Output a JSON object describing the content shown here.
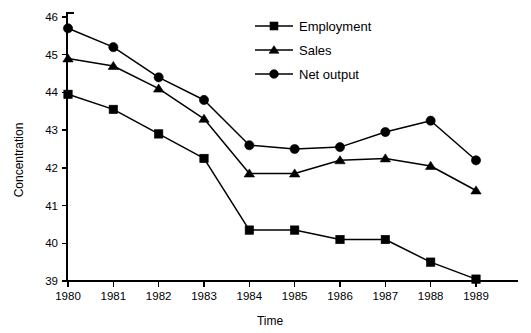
{
  "chart_data": {
    "type": "line",
    "title": "",
    "xlabel": "Time",
    "ylabel": "Concentration",
    "categories": [
      "1980",
      "1981",
      "1982",
      "1983",
      "1984",
      "1985",
      "1986",
      "1987",
      "1988",
      "1989"
    ],
    "x": [
      1980,
      1981,
      1982,
      1983,
      1984,
      1985,
      1986,
      1987,
      1988,
      1989
    ],
    "xlim": [
      1980,
      1989
    ],
    "ylim": [
      39,
      46
    ],
    "yticks": [
      39,
      40,
      41,
      42,
      43,
      44,
      45,
      46
    ],
    "ytick_labels": [
      "39",
      "40",
      "41",
      "42",
      "43",
      "44",
      "45",
      "46"
    ],
    "grid": false,
    "legend_position": "top-center",
    "series": [
      {
        "name": "Employment",
        "marker": "square",
        "values": [
          43.95,
          43.55,
          42.9,
          42.25,
          40.35,
          40.35,
          40.1,
          40.1,
          39.5,
          39.05
        ]
      },
      {
        "name": "Sales",
        "marker": "triangle",
        "values": [
          44.9,
          44.7,
          44.1,
          43.3,
          41.85,
          41.85,
          42.2,
          42.25,
          42.05,
          41.4
        ]
      },
      {
        "name": "Net output",
        "marker": "circle",
        "values": [
          45.7,
          45.2,
          44.4,
          43.8,
          42.6,
          42.5,
          42.55,
          42.95,
          43.25,
          42.2
        ]
      }
    ]
  },
  "axes": {
    "y_title": "Concentration",
    "x_title": "Time"
  },
  "legend": {
    "entries": [
      {
        "label": "Employment",
        "marker": "square"
      },
      {
        "label": "Sales",
        "marker": "triangle"
      },
      {
        "label": "Net output",
        "marker": "circle"
      }
    ]
  },
  "colors": {
    "ink": "#000000",
    "background": "#ffffff"
  }
}
